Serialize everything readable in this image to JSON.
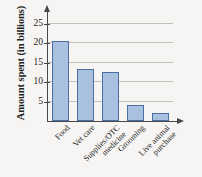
{
  "chart_data": {
    "type": "bar",
    "title": "",
    "xlabel": "",
    "ylabel": "Amount spent (in billions)",
    "categories": [
      "Food",
      "Vet care",
      "Supplies/OTC\nmedicine",
      "Grooming",
      "Live animal\npurchase"
    ],
    "values": [
      20.5,
      13.5,
      12.5,
      4,
      2
    ],
    "ylim": [
      0,
      27
    ],
    "yticks": [
      5,
      10,
      15,
      20,
      25
    ],
    "ytick_labels": [
      "5",
      "10",
      "15",
      "20",
      "25"
    ],
    "grid": "horizontal",
    "legend": "none",
    "bar_fill_color": "#a9c1df",
    "bar_border_color": "#4a6fa2",
    "gridline_color": "#c2c0bd",
    "axis_color": "#4a4846",
    "background_color": "#f6f5f3",
    "x_axis_arrow": true,
    "y_axis_arrow": true,
    "x_label_rotation_deg": -45
  }
}
